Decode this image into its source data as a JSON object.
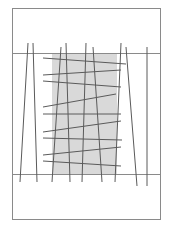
{
  "diagram": {
    "width": 172,
    "height": 235,
    "colors": {
      "background": "#ffffff",
      "frame": "#8a8a8a",
      "shade": "#d9d9d9",
      "line": "#5a5a5a"
    },
    "frame": {
      "x": 12,
      "y": 8,
      "w": 148,
      "h": 211
    },
    "bands": [
      {
        "y": 53,
        "x1": 12,
        "x2": 160
      },
      {
        "y": 174,
        "x1": 12,
        "x2": 160
      }
    ],
    "shaded_region": {
      "x": 52,
      "y": 53,
      "w": 65,
      "h": 121
    },
    "vertical_lines": [
      {
        "x1": 28,
        "y1": 43,
        "x2": 20,
        "y2": 182
      },
      {
        "x1": 33,
        "y1": 43,
        "x2": 37,
        "y2": 182
      },
      {
        "x1": 61,
        "y1": 47,
        "x2": 52,
        "y2": 182
      },
      {
        "x1": 66,
        "y1": 43,
        "x2": 70,
        "y2": 182
      },
      {
        "x1": 86,
        "y1": 43,
        "x2": 82,
        "y2": 182
      },
      {
        "x1": 93,
        "y1": 47,
        "x2": 102,
        "y2": 182
      },
      {
        "x1": 121,
        "y1": 43,
        "x2": 115,
        "y2": 182
      },
      {
        "x1": 126,
        "y1": 47,
        "x2": 137,
        "y2": 186
      },
      {
        "x1": 147,
        "y1": 47,
        "x2": 147,
        "y2": 186
      }
    ],
    "cross_lines": [
      {
        "x1": 43,
        "y1": 58,
        "x2": 126,
        "y2": 64
      },
      {
        "x1": 43,
        "y1": 75,
        "x2": 121,
        "y2": 70
      },
      {
        "x1": 43,
        "y1": 81,
        "x2": 121,
        "y2": 87
      },
      {
        "x1": 43,
        "y1": 107,
        "x2": 116,
        "y2": 94
      },
      {
        "x1": 43,
        "y1": 114,
        "x2": 121,
        "y2": 114
      },
      {
        "x1": 43,
        "y1": 132,
        "x2": 121,
        "y2": 121
      },
      {
        "x1": 43,
        "y1": 138,
        "x2": 122,
        "y2": 140
      },
      {
        "x1": 43,
        "y1": 155,
        "x2": 121,
        "y2": 147
      },
      {
        "x1": 43,
        "y1": 161,
        "x2": 121,
        "y2": 166
      }
    ]
  }
}
